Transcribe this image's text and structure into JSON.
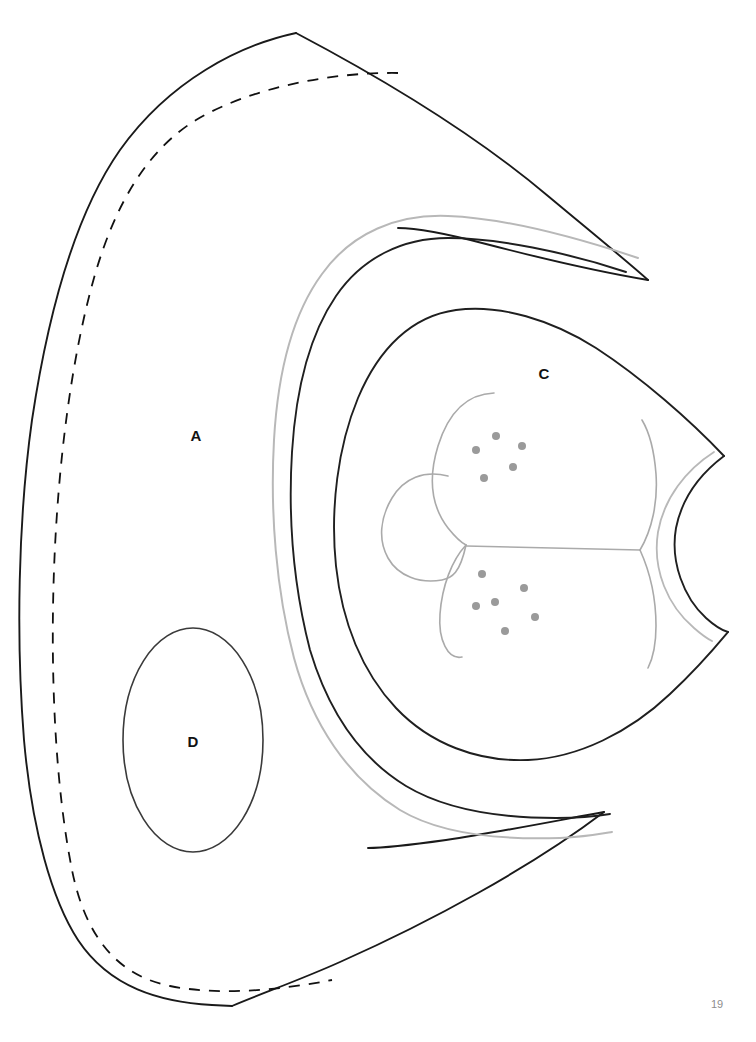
{
  "page": {
    "number": "19",
    "background_color": "#ffffff"
  },
  "figure": {
    "type": "line-art-diagram",
    "title": "",
    "stroke_colors": {
      "primary_outline": "#1a1a1a",
      "secondary_outline": "#3a3a3a",
      "light_guide": "#b4b4b4",
      "inner_detail": "#a8a8a8",
      "dot_fill": "#9a9a9a"
    },
    "labels": [
      {
        "id": "label-a",
        "text": "A",
        "x": 196,
        "y": 437
      },
      {
        "id": "label-c",
        "text": "C",
        "x": 544,
        "y": 375
      },
      {
        "id": "label-d",
        "text": "D",
        "x": 193,
        "y": 743
      }
    ],
    "dot_clusters": [
      {
        "id": "upper-dot-cluster",
        "count": 5,
        "radius": 4,
        "dots": [
          {
            "x": 496,
            "y": 436
          },
          {
            "x": 476,
            "y": 450
          },
          {
            "x": 522,
            "y": 446
          },
          {
            "x": 513,
            "y": 467
          },
          {
            "x": 484,
            "y": 478
          }
        ]
      },
      {
        "id": "lower-dot-cluster",
        "count": 6,
        "radius": 4,
        "dots": [
          {
            "x": 482,
            "y": 574
          },
          {
            "x": 524,
            "y": 588
          },
          {
            "x": 476,
            "y": 606
          },
          {
            "x": 495,
            "y": 602
          },
          {
            "x": 535,
            "y": 617
          },
          {
            "x": 505,
            "y": 631
          }
        ]
      }
    ],
    "outlines": {
      "outer_body": "Outer solid body contour with upper and lower pointed tips",
      "inner_dashed": "Dashed inner margin line following the left body contour",
      "light_arc_band": "Light gray arc band nested inside the body",
      "mid_arc_band": "Dark arc band nested inside the light band",
      "inner_chamber": "Inner chamber outline enclosing label C",
      "ellipse_d": "Ellipse region labelled D",
      "inner_detail_lobes": "Gray interior lobe and septum detail lines"
    }
  }
}
